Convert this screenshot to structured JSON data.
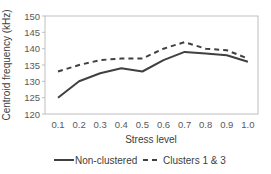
{
  "chart_data": {
    "type": "line",
    "title": "",
    "xlabel": "Stress level",
    "ylabel": "Centroid frequency (kHz)",
    "categories": [
      "0.1",
      "0.2",
      "0.3",
      "0.4",
      "0.5",
      "0.6",
      "0.7",
      "0.8",
      "0.9",
      "1.0"
    ],
    "x": [
      0.1,
      0.2,
      0.3,
      0.4,
      0.5,
      0.6,
      0.7,
      0.8,
      0.9,
      1.0
    ],
    "ylim": [
      120,
      150
    ],
    "yticks": [
      120,
      125,
      130,
      135,
      140,
      145,
      150
    ],
    "grid": false,
    "legend_position": "bottom",
    "series": [
      {
        "name": "Non-clustered",
        "style": "solid",
        "color": "#404040",
        "values": [
          125,
          130,
          132.5,
          134,
          133,
          136.5,
          139,
          138.5,
          138,
          136
        ]
      },
      {
        "name": "Clusters 1 & 3",
        "style": "dashed",
        "color": "#404040",
        "values": [
          133,
          135,
          136.5,
          137,
          137,
          140,
          142,
          140,
          139.5,
          137
        ]
      }
    ]
  },
  "layout": {
    "plot": {
      "left": 45,
      "right": 258,
      "top": 16,
      "bottom": 114
    },
    "x_first_px": 58,
    "x_step_px": 21.1
  }
}
